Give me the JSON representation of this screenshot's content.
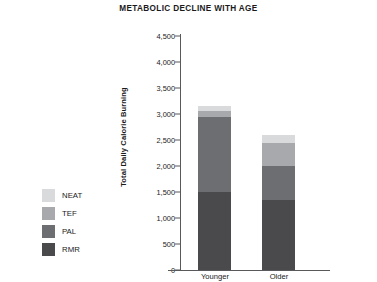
{
  "chart_data": {
    "type": "bar",
    "subtype": "stacked",
    "title": "METABOLIC DECLINE WITH AGE",
    "xlabel": "",
    "ylabel": "Total Daily Calorie Burning",
    "categories": [
      "Younger",
      "Older"
    ],
    "ylim": [
      0,
      4500
    ],
    "ytick_step": 500,
    "ytick_labels": [
      "4,500",
      "4,000",
      "3,500",
      "3,000",
      "2,500",
      "2,000",
      "1,500",
      "1,000",
      "500",
      "0"
    ],
    "ytick_values": [
      4500,
      4000,
      3500,
      3000,
      2500,
      2000,
      1500,
      1000,
      500,
      0
    ],
    "grid": false,
    "legend_position": "left",
    "series": [
      {
        "name": "RMR",
        "values": [
          1500,
          1350
        ],
        "color": "#4a4a4c"
      },
      {
        "name": "PAL",
        "values": [
          1450,
          650
        ],
        "color": "#6d6e71"
      },
      {
        "name": "TEF",
        "values": [
          100,
          450
        ],
        "color": "#a7a9ac"
      },
      {
        "name": "NEAT",
        "values": [
          100,
          150
        ],
        "color": "#d9dadb"
      }
    ],
    "totals": [
      3150,
      2600
    ],
    "legend_order": [
      "NEAT",
      "TEF",
      "PAL",
      "RMR"
    ]
  },
  "colors": {
    "axis": "#58595b",
    "text": "#1a1a1a",
    "background": "#ffffff"
  }
}
